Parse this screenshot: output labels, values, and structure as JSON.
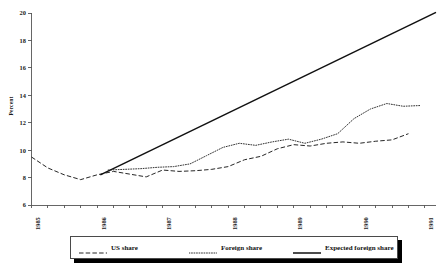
{
  "chart_data": {
    "type": "line",
    "title": "",
    "subtitle": "",
    "xlabel": "",
    "ylabel": "Percent",
    "xlim": [
      1985.0,
      1991.17
    ],
    "ylim": [
      6,
      20
    ],
    "grid": false,
    "legend_position": "bottom",
    "y_ticks": [
      6,
      8,
      10,
      12,
      14,
      16,
      18,
      20
    ],
    "y_tick_labels": [
      "6",
      "8",
      "10",
      "12",
      "14",
      "16",
      "18",
      "20"
    ],
    "x_ticks": [
      1985,
      1986,
      1987,
      1988,
      1989,
      1990,
      1991
    ],
    "x_tick_labels": [
      "1985",
      "1986",
      "1987",
      "1988",
      "1989",
      "1990",
      "1991"
    ],
    "x_minor_tick_interval": 0.25,
    "series": [
      {
        "name": "US share",
        "style": "dashed",
        "color": "#262626",
        "x": [
          1985.0,
          1985.25,
          1985.5,
          1985.75,
          1986.0,
          1986.25,
          1986.5,
          1986.75,
          1987.0,
          1987.25,
          1987.5,
          1987.75,
          1988.0,
          1988.25,
          1988.5,
          1988.75,
          1989.0,
          1989.25,
          1989.5,
          1989.75,
          1990.0,
          1990.25,
          1990.5,
          1990.75
        ],
        "values": [
          9.5,
          8.7,
          8.2,
          7.85,
          8.2,
          8.45,
          8.25,
          8.05,
          8.55,
          8.45,
          8.5,
          8.6,
          8.8,
          9.3,
          9.55,
          10.1,
          10.4,
          10.3,
          10.5,
          10.6,
          10.5,
          10.65,
          10.75,
          11.2
        ]
      },
      {
        "name": "Foreign share",
        "style": "dotted",
        "color": "#333333",
        "x": [
          1986.17,
          1986.42,
          1986.67,
          1986.92,
          1987.17,
          1987.42,
          1987.67,
          1987.92,
          1988.17,
          1988.42,
          1988.67,
          1988.92,
          1989.17,
          1989.42,
          1989.67,
          1989.92,
          1990.17,
          1990.42,
          1990.67,
          1990.92
        ],
        "values": [
          8.55,
          8.6,
          8.65,
          8.75,
          8.8,
          9.0,
          9.6,
          10.2,
          10.5,
          10.35,
          10.6,
          10.8,
          10.5,
          10.8,
          11.2,
          12.3,
          13.0,
          13.4,
          13.2,
          13.25
        ]
      },
      {
        "name": "Expected foreign share",
        "style": "solid",
        "color": "#111111",
        "x": [
          1986.05,
          1991.17
        ],
        "values": [
          8.2,
          20.05
        ]
      }
    ]
  },
  "legend": {
    "items": [
      {
        "label": "US share",
        "style": "dashed"
      },
      {
        "label": "Foreign share",
        "style": "dotted"
      },
      {
        "label": "Expected foreign share",
        "style": "solid"
      }
    ]
  },
  "colors": {
    "axis": "#555555",
    "us_share": "#262626",
    "foreign_share": "#333333",
    "expected_foreign_share": "#111111",
    "legend_shadow": "#000000",
    "background": "#ffffff"
  }
}
